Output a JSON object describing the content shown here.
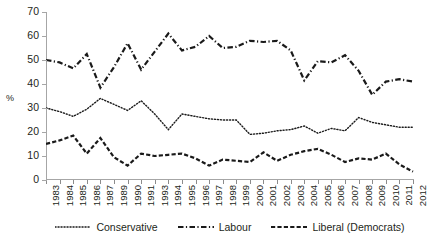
{
  "chart_data": {
    "type": "line",
    "title": "",
    "subtitle": "",
    "xlabel": "",
    "ylabel": "%",
    "ylim": [
      0,
      70
    ],
    "ytick_step": 10,
    "yticks": [
      0,
      10,
      20,
      30,
      40,
      50,
      60,
      70
    ],
    "grid": false,
    "legend_position": "bottom",
    "categories": [
      "1983",
      "1984",
      "1985",
      "1986",
      "1987",
      "1989",
      "1990",
      "1991",
      "1993",
      "1994",
      "1995",
      "1996",
      "1997",
      "1998",
      "1999",
      "2000",
      "2001",
      "2002",
      "2003",
      "2004",
      "2005",
      "2006",
      "2007",
      "2008",
      "2009",
      "2010",
      "2011",
      "2012"
    ],
    "series": [
      {
        "name": "Conservative",
        "style": "dotted",
        "color": "#1a1a1a",
        "values": [
          30.0,
          28.5,
          26.5,
          29.5,
          34.0,
          31.5,
          29.0,
          33.0,
          27.5,
          21.0,
          27.5,
          26.5,
          25.5,
          25.0,
          25.0,
          19.0,
          19.5,
          20.5,
          21.0,
          22.5,
          19.5,
          21.5,
          20.5,
          26.0,
          24.0,
          23.0,
          22.0,
          22.0
        ]
      },
      {
        "name": "Labour",
        "style": "dash-dot",
        "color": "#1a1a1a",
        "values": [
          50.0,
          49.0,
          46.5,
          52.5,
          38.5,
          47.0,
          57.0,
          46.0,
          53.5,
          61.0,
          54.0,
          55.5,
          60.0,
          55.0,
          55.5,
          58.0,
          57.5,
          58.0,
          54.0,
          41.5,
          49.5,
          49.0,
          52.0,
          45.5,
          35.5,
          41.0,
          42.0,
          41.0
        ]
      },
      {
        "name": "Liberal (Democrats)",
        "style": "dashed",
        "color": "#1a1a1a",
        "values": [
          15.0,
          16.5,
          18.5,
          11.0,
          17.5,
          9.5,
          6.0,
          11.0,
          10.0,
          10.5,
          11.0,
          9.0,
          6.0,
          8.5,
          8.0,
          7.5,
          11.5,
          8.0,
          10.5,
          12.0,
          13.0,
          10.5,
          7.5,
          9.0,
          8.5,
          11.0,
          6.5,
          3.5
        ]
      }
    ]
  }
}
